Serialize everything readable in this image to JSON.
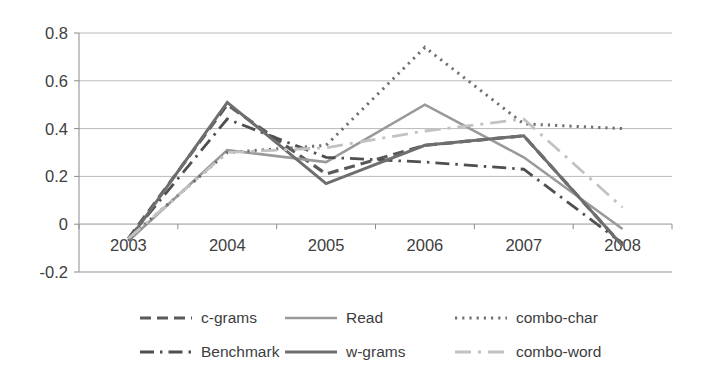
{
  "chart_data": {
    "type": "line",
    "title": "",
    "subtitle": "",
    "xlabel": "",
    "ylabel": "",
    "categories": [
      "2003",
      "2004",
      "2005",
      "2006",
      "2007",
      "2008"
    ],
    "ylim": [
      -0.2,
      0.8
    ],
    "yticks": [
      "0.8",
      "0.6",
      "0.4",
      "0.2",
      "0",
      "-0.2"
    ],
    "ytick_values": [
      0.8,
      0.6,
      0.4,
      0.2,
      0,
      -0.2
    ],
    "grid": true,
    "legend_position": "bottom",
    "series": [
      {
        "name": "c-grams",
        "values": [
          -0.06,
          0.5,
          0.21,
          0.33,
          0.37,
          -0.09
        ],
        "color": "#595959",
        "style": "dashed",
        "dasharray": "11,6",
        "width": 3.2
      },
      {
        "name": "Read",
        "values": [
          -0.07,
          0.31,
          0.26,
          0.5,
          0.28,
          -0.02
        ],
        "color": "#9a9a9a",
        "style": "solid",
        "dasharray": "none",
        "width": 2.6
      },
      {
        "name": "combo-char",
        "values": [
          -0.06,
          0.3,
          0.33,
          0.74,
          0.42,
          0.4
        ],
        "color": "#707070",
        "style": "dotted",
        "dasharray": "2.2,5",
        "width": 3.0
      },
      {
        "name": "Benchmark",
        "values": [
          -0.06,
          0.44,
          0.28,
          0.26,
          0.23,
          -0.08
        ],
        "color": "#4f4f4f",
        "style": "dash-dot",
        "dasharray": "14,6,2.5,6",
        "width": 2.8
      },
      {
        "name": "w-grams",
        "values": [
          -0.07,
          0.51,
          0.17,
          0.33,
          0.37,
          -0.09
        ],
        "color": "#6e6e6e",
        "style": "solid",
        "dasharray": "none",
        "width": 3.0
      },
      {
        "name": "combo-word",
        "values": [
          -0.06,
          0.3,
          0.32,
          0.39,
          0.44,
          0.07
        ],
        "color": "#c2c2c2",
        "style": "dash-dot",
        "dasharray": "16,7,3,7",
        "width": 2.8
      }
    ]
  },
  "legend": {
    "entries": [
      {
        "label": "c-grams"
      },
      {
        "label": "Read"
      },
      {
        "label": "combo-char"
      },
      {
        "label": "Benchmark"
      },
      {
        "label": "w-grams"
      },
      {
        "label": "combo-word"
      }
    ]
  },
  "axes": {
    "y_labels": [
      "0.8",
      "0.6",
      "0.4",
      "0.2",
      "0",
      "-0.2"
    ],
    "x_labels": [
      "2003",
      "2004",
      "2005",
      "2006",
      "2007",
      "2008"
    ]
  }
}
